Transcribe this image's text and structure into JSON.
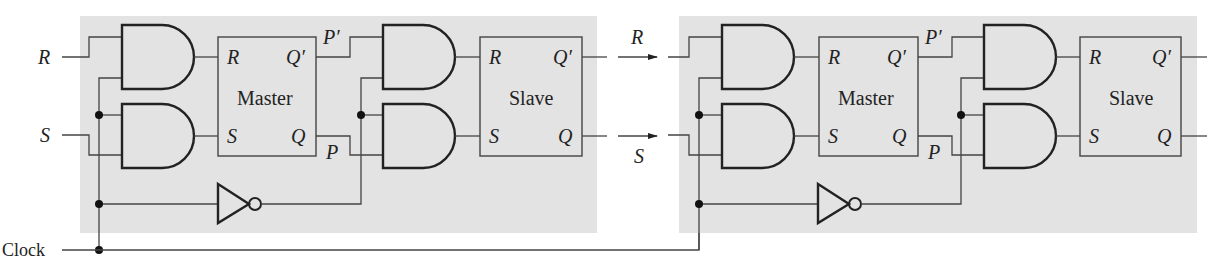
{
  "diagram": {
    "type": "master-slave SR flip-flop cascade",
    "inputs": {
      "r": "R",
      "s": "S",
      "clock": "Clock"
    },
    "stages": [
      {
        "master": {
          "title": "Master",
          "in_r": "R",
          "in_s": "S",
          "out_qp": "Q′",
          "out_q": "Q"
        },
        "intermediate": {
          "p_prime": "P′",
          "p": "P"
        },
        "slave": {
          "title": "Slave",
          "in_r": "R",
          "in_s": "S",
          "out_qp": "Q′",
          "out_q": "Q"
        }
      },
      {
        "master": {
          "title": "Master",
          "in_r": "R",
          "in_s": "S",
          "out_qp": "Q′",
          "out_q": "Q"
        },
        "intermediate": {
          "p_prime": "P′",
          "p": "P"
        },
        "slave": {
          "title": "Slave",
          "in_r": "R",
          "in_s": "S",
          "out_qp": "Q′",
          "out_q": "Q"
        }
      }
    ],
    "link_labels": {
      "r": "R",
      "s": "S"
    },
    "colors": {
      "panel": "#e3e3e3",
      "line": "#444444",
      "gate": "#222222"
    }
  }
}
